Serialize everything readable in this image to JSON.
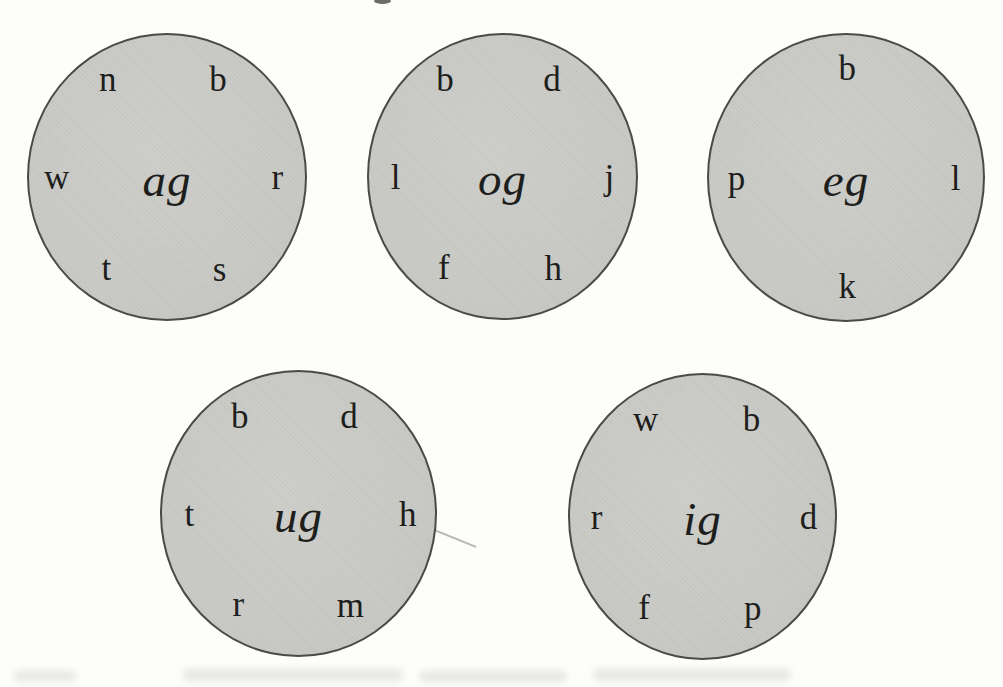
{
  "colors": {
    "page_bg": "#fdfdfc",
    "circle_fill": "#c8c9c5",
    "circle_edge": "#4a4a48",
    "ink": "#1e1e1c"
  },
  "word_families": [
    {
      "rime": "ag",
      "onsets": [
        {
          "char": "n",
          "pos": "tl"
        },
        {
          "char": "b",
          "pos": "tr"
        },
        {
          "char": "w",
          "pos": "l"
        },
        {
          "char": "r",
          "pos": "r"
        },
        {
          "char": "t",
          "pos": "bl"
        },
        {
          "char": "s",
          "pos": "br"
        }
      ]
    },
    {
      "rime": "og",
      "onsets": [
        {
          "char": "b",
          "pos": "tl"
        },
        {
          "char": "d",
          "pos": "tr"
        },
        {
          "char": "l",
          "pos": "l"
        },
        {
          "char": "j",
          "pos": "r"
        },
        {
          "char": "f",
          "pos": "bl"
        },
        {
          "char": "h",
          "pos": "br"
        }
      ]
    },
    {
      "rime": "eg",
      "onsets": [
        {
          "char": "b",
          "pos": "t"
        },
        {
          "char": "p",
          "pos": "l"
        },
        {
          "char": "l",
          "pos": "r"
        },
        {
          "char": "k",
          "pos": "b"
        }
      ]
    },
    {
      "rime": "ug",
      "onsets": [
        {
          "char": "b",
          "pos": "tl"
        },
        {
          "char": "d",
          "pos": "tr"
        },
        {
          "char": "t",
          "pos": "l"
        },
        {
          "char": "h",
          "pos": "r"
        },
        {
          "char": "r",
          "pos": "bl"
        },
        {
          "char": "m",
          "pos": "br"
        }
      ]
    },
    {
      "rime": "ig",
      "onsets": [
        {
          "char": "w",
          "pos": "tl"
        },
        {
          "char": "b",
          "pos": "tr"
        },
        {
          "char": "r",
          "pos": "l"
        },
        {
          "char": "d",
          "pos": "r"
        },
        {
          "char": "f",
          "pos": "bl"
        },
        {
          "char": "p",
          "pos": "br"
        }
      ]
    }
  ]
}
